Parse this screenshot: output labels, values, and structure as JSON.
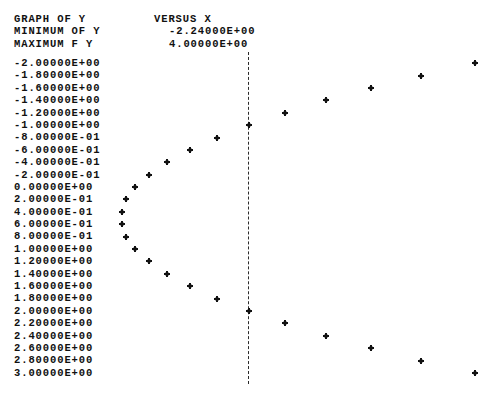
{
  "header": {
    "title_label": "GRAPH OF Y",
    "title_value": "VERSUS X",
    "min_label": "MINIMUM OF Y",
    "min_value": "-2.24000E+00",
    "max_label": "MAXIMUM F Y",
    "max_value": "4.00000E+00"
  },
  "axis_marker": "|",
  "point_glyph": "*",
  "chart_data": {
    "type": "scatter",
    "title": "GRAPH OF Y VERSUS X",
    "xlabel": "X",
    "ylabel": "Y",
    "orientation": "horizontal-printer-plot",
    "grid": false,
    "legend": null,
    "xlim": [
      -2.24,
      4.0
    ],
    "ylim": [
      -2.0,
      3.0
    ],
    "x_axis_line_value": 0.0,
    "x_min_annotation": "-2.24000E+00",
    "x_max_annotation": "4.00000E+00",
    "y_tick_labels": [
      "-2.00000E+00",
      "-1.80000E+00",
      "-1.60000E+00",
      "-1.40000E+00",
      "-1.20000E+00",
      "-1.00000E+00",
      "-8.00000E-01",
      "-6.00000E-01",
      "-4.00000E-01",
      "-2.00000E-01",
      "0.00000E+00",
      "2.00000E-01",
      "4.00000E-01",
      "6.00000E-01",
      "8.00000E-01",
      "1.00000E+00",
      "1.20000E+00",
      "1.40000E+00",
      "1.60000E+00",
      "1.80000E+00",
      "2.00000E+00",
      "2.20000E+00",
      "2.40000E+00",
      "2.60000E+00",
      "2.80000E+00",
      "3.00000E+00"
    ],
    "y": [
      -2.0,
      -1.8,
      -1.6,
      -1.4,
      -1.2,
      -1.0,
      -0.8,
      -0.6,
      -0.4,
      -0.2,
      0.0,
      0.2,
      0.4,
      0.6,
      0.8,
      1.0,
      1.2,
      1.4,
      1.6,
      1.8,
      2.0,
      2.2,
      2.4,
      2.6,
      2.8,
      3.0
    ],
    "x": [
      4.0,
      3.04,
      2.16,
      1.36,
      0.64,
      0.0,
      -0.56,
      -1.04,
      -1.44,
      -1.76,
      -2.0,
      -2.16,
      -2.24,
      -2.24,
      -2.16,
      -2.0,
      -1.76,
      -1.44,
      -1.04,
      -0.56,
      0.0,
      0.64,
      1.36,
      2.16,
      3.04,
      4.0
    ],
    "equation_note": "x = y^2 - y - 2"
  }
}
